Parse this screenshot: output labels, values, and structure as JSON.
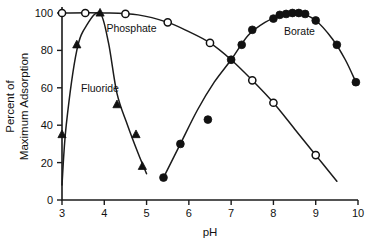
{
  "chart_data": {
    "type": "scatter",
    "title": "",
    "xlabel": "pH",
    "ylabel": "Percent of Maximum Adsorption",
    "ylabel_line1": "Percent of",
    "ylabel_line2": "Maximum Adsorption",
    "xlim": [
      3,
      10
    ],
    "ylim": [
      0,
      100
    ],
    "xticks": [
      "3",
      "4",
      "5",
      "6",
      "7",
      "8",
      "9",
      "10"
    ],
    "xtick_values": [
      3,
      4,
      5,
      6,
      7,
      8,
      9,
      10
    ],
    "yticks": [
      "0",
      "20",
      "40",
      "60",
      "80",
      "100"
    ],
    "ytick_values": [
      0,
      20,
      40,
      60,
      80,
      100
    ],
    "grid": false,
    "legend_position": "inline-annotations",
    "series": [
      {
        "name": "Fluoride",
        "marker": "filled-triangle",
        "color": "#111111",
        "label_x": 3.45,
        "label_y": 58,
        "points": [
          {
            "x": 3.0,
            "y": 35
          },
          {
            "x": 3.35,
            "y": 83
          },
          {
            "x": 3.9,
            "y": 100
          },
          {
            "x": 4.3,
            "y": 51
          },
          {
            "x": 4.75,
            "y": 35
          },
          {
            "x": 4.9,
            "y": 18
          }
        ],
        "curve": [
          {
            "x": 3.0,
            "y": 8
          },
          {
            "x": 3.1,
            "y": 40
          },
          {
            "x": 3.35,
            "y": 80
          },
          {
            "x": 3.6,
            "y": 94
          },
          {
            "x": 3.9,
            "y": 100
          },
          {
            "x": 4.1,
            "y": 84
          },
          {
            "x": 4.3,
            "y": 57
          },
          {
            "x": 4.55,
            "y": 40
          },
          {
            "x": 4.8,
            "y": 25
          },
          {
            "x": 5.0,
            "y": 14
          }
        ]
      },
      {
        "name": "Phosphate",
        "marker": "open-circle",
        "color": "#111111",
        "label_x": 4.05,
        "label_y": 90,
        "points": [
          {
            "x": 3.0,
            "y": 100
          },
          {
            "x": 3.55,
            "y": 100
          },
          {
            "x": 4.5,
            "y": 99.5
          },
          {
            "x": 5.5,
            "y": 95
          },
          {
            "x": 6.5,
            "y": 84
          },
          {
            "x": 7.5,
            "y": 64
          },
          {
            "x": 8.0,
            "y": 52
          },
          {
            "x": 9.0,
            "y": 24
          }
        ],
        "curve": [
          {
            "x": 3.0,
            "y": 100
          },
          {
            "x": 4.0,
            "y": 100
          },
          {
            "x": 4.8,
            "y": 99
          },
          {
            "x": 5.5,
            "y": 95
          },
          {
            "x": 6.0,
            "y": 90
          },
          {
            "x": 6.5,
            "y": 84
          },
          {
            "x": 7.0,
            "y": 75
          },
          {
            "x": 7.5,
            "y": 64
          },
          {
            "x": 8.0,
            "y": 52
          },
          {
            "x": 8.5,
            "y": 38
          },
          {
            "x": 9.0,
            "y": 24
          },
          {
            "x": 9.5,
            "y": 10
          }
        ]
      },
      {
        "name": "Borate",
        "marker": "filled-circle",
        "color": "#111111",
        "label_x": 8.25,
        "label_y": 88,
        "points": [
          {
            "x": 5.4,
            "y": 12
          },
          {
            "x": 5.8,
            "y": 30
          },
          {
            "x": 6.45,
            "y": 43
          },
          {
            "x": 7.0,
            "y": 75
          },
          {
            "x": 7.25,
            "y": 83
          },
          {
            "x": 7.5,
            "y": 91
          },
          {
            "x": 8.0,
            "y": 97
          },
          {
            "x": 8.15,
            "y": 99
          },
          {
            "x": 8.3,
            "y": 99.5
          },
          {
            "x": 8.45,
            "y": 100
          },
          {
            "x": 8.6,
            "y": 100
          },
          {
            "x": 8.75,
            "y": 99.5
          },
          {
            "x": 9.0,
            "y": 96
          },
          {
            "x": 9.5,
            "y": 83
          },
          {
            "x": 9.95,
            "y": 63
          }
        ],
        "curve": [
          {
            "x": 5.4,
            "y": 12
          },
          {
            "x": 5.8,
            "y": 30
          },
          {
            "x": 6.2,
            "y": 48
          },
          {
            "x": 6.6,
            "y": 63
          },
          {
            "x": 7.0,
            "y": 75
          },
          {
            "x": 7.4,
            "y": 88
          },
          {
            "x": 7.8,
            "y": 95
          },
          {
            "x": 8.2,
            "y": 99
          },
          {
            "x": 8.6,
            "y": 100
          },
          {
            "x": 9.0,
            "y": 96
          },
          {
            "x": 9.4,
            "y": 86
          },
          {
            "x": 9.7,
            "y": 75
          },
          {
            "x": 9.95,
            "y": 63
          }
        ]
      }
    ]
  }
}
